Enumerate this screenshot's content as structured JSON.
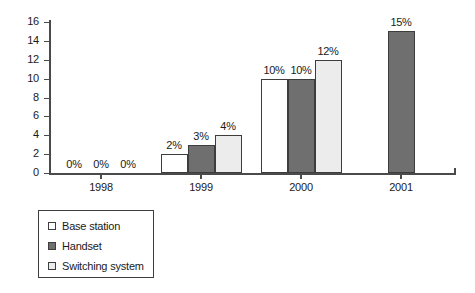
{
  "chart_data": {
    "type": "bar",
    "title": "",
    "subtitle": "",
    "xlabel": "",
    "ylabel": "",
    "categories": [
      "1998",
      "1999",
      "2000",
      "2001"
    ],
    "series": [
      {
        "name": "Base station",
        "color": "#ffffff",
        "values": [
          0,
          2,
          10,
          null
        ],
        "labels": [
          "0%",
          "2%",
          "10%",
          ""
        ]
      },
      {
        "name": "Handset",
        "color": "#6f6f6f",
        "values": [
          0,
          3,
          10,
          15
        ],
        "labels": [
          "0%",
          "3%",
          "10%",
          "15%"
        ]
      },
      {
        "name": "Switching system",
        "color": "#ececec",
        "values": [
          0,
          4,
          12,
          null
        ],
        "labels": [
          "0%",
          "4%",
          "12%",
          ""
        ]
      }
    ],
    "ylim": [
      0,
      16
    ],
    "yticks": [
      0,
      2,
      4,
      6,
      8,
      10,
      12,
      14,
      16
    ],
    "ytick_labels": [
      "0",
      "2",
      "4",
      "6",
      "8",
      "10",
      "12",
      "14",
      "16"
    ],
    "grid": false,
    "legend_position": "below-left",
    "axis_color": "#4a4a4a",
    "bar_border_color": "#3d3d3d"
  },
  "legend": {
    "items": [
      {
        "label": "Base station",
        "swatch": "series-base"
      },
      {
        "label": "Handset",
        "swatch": "series-hand"
      },
      {
        "label": "Switching system",
        "swatch": "series-switch"
      }
    ]
  }
}
